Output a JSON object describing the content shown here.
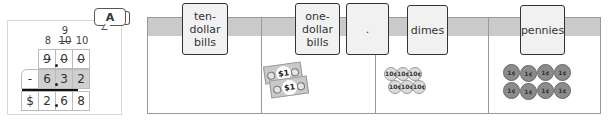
{
  "worked_problem": {
    "badge": "A",
    "carries": {
      "ones_col": "8",
      "tenths_top": "9",
      "tenths_struck": "10",
      "hundredths": "10"
    },
    "minuend": [
      "9",
      "0",
      "0"
    ],
    "operator": "-",
    "subtrahend": [
      "6",
      "3",
      "2"
    ],
    "currency": "$",
    "difference": [
      "2",
      "6",
      "8"
    ]
  },
  "place_value_table": {
    "headers": [
      {
        "label_lines": [
          "ten-",
          "dollar",
          "bills"
        ]
      },
      {
        "label_lines": [
          "one-",
          "dollar",
          "bills"
        ]
      },
      {
        "label_lines": [
          "."
        ]
      },
      {
        "label_lines": [
          "dimes"
        ]
      },
      {
        "label_lines": [
          "pennies"
        ]
      }
    ],
    "columns": [
      {
        "name": "ten-dollar bills",
        "contents": []
      },
      {
        "name": "one-dollar bills",
        "contents": [
          "$1",
          "$1"
        ]
      },
      {
        "name": "dimes",
        "contents": [
          "10¢",
          "10¢",
          "10¢",
          "10¢",
          "10¢",
          "10¢"
        ]
      },
      {
        "name": "pennies",
        "contents": [
          "1¢",
          "1¢",
          "1¢",
          "1¢",
          "1¢",
          "1¢",
          "1¢",
          "1¢"
        ]
      }
    ]
  }
}
